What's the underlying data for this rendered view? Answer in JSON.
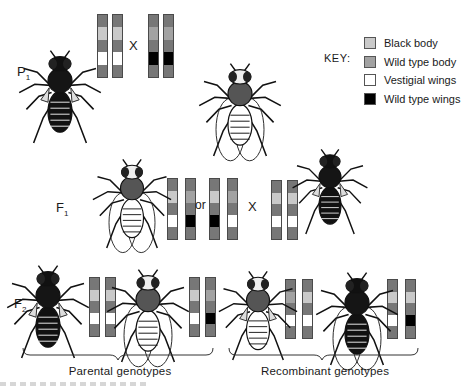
{
  "generations": {
    "p1": {
      "label": "P",
      "sub": "1"
    },
    "f1": {
      "label": "F",
      "sub": "1"
    },
    "f2": {
      "label": "F",
      "sub": "2"
    }
  },
  "symbols": {
    "cross": "X",
    "or": "or"
  },
  "colors": {
    "chromosome": "#777777",
    "black_body": "#c9c9c9",
    "wild_type_body": "#a2a2a2",
    "vestigial_wings": "#ffffff",
    "wild_type_wings": "#000000"
  },
  "key": {
    "title": "KEY:",
    "items": [
      {
        "label": "Black body",
        "color": "#c9c9c9"
      },
      {
        "label": "Wild type body",
        "color": "#a2a2a2"
      },
      {
        "label": "Vestigial wings",
        "color": "#ffffff"
      },
      {
        "label": "Wild type wings",
        "color": "#000000"
      }
    ]
  },
  "groups": {
    "parental": "Parental genotypes",
    "recombinant": "Recombinant genotypes"
  },
  "chromosome_pairs": {
    "p1_left": [
      [
        "black",
        "vestigial"
      ],
      [
        "black",
        "vestigial"
      ]
    ],
    "p1_right": [
      [
        "wild",
        "wild"
      ],
      [
        "wild",
        "wild"
      ]
    ],
    "f1_option_a": [
      [
        "black",
        "vestigial"
      ],
      [
        "wild",
        "wild"
      ]
    ],
    "f1_option_b": [
      [
        "black",
        "wild"
      ],
      [
        "wild",
        "vestigial"
      ]
    ],
    "f1_tester": [
      [
        "black",
        "vestigial"
      ],
      [
        "black",
        "vestigial"
      ]
    ],
    "f2_parental_1": [
      [
        "black",
        "vestigial"
      ],
      [
        "black",
        "vestigial"
      ]
    ],
    "f2_parental_2": [
      [
        "black",
        "vestigial"
      ],
      [
        "wild",
        "wild"
      ]
    ],
    "f2_recombinant_1": [
      [
        "wild",
        "vestigial"
      ],
      [
        "black",
        "vestigial"
      ]
    ],
    "f2_recombinant_2": [
      [
        "black",
        "vestigial"
      ],
      [
        "black",
        "wild"
      ]
    ]
  },
  "flies": [
    {
      "id": "p1-black-vestigial",
      "body": "black",
      "wings": "vestigial"
    },
    {
      "id": "p1-wild-type",
      "body": "wild",
      "wings": "wild"
    },
    {
      "id": "f1-heterozygote",
      "body": "wild",
      "wings": "wild"
    },
    {
      "id": "f1-tester-black-vestigial",
      "body": "black",
      "wings": "vestigial"
    },
    {
      "id": "f2-black-vestigial",
      "body": "black",
      "wings": "vestigial"
    },
    {
      "id": "f2-wild-type",
      "body": "wild",
      "wings": "wild"
    },
    {
      "id": "f2-wild-body-vestigial",
      "body": "wild",
      "wings": "vestigial"
    },
    {
      "id": "f2-black-body-wild-wings",
      "body": "black",
      "wings": "wild"
    }
  ]
}
